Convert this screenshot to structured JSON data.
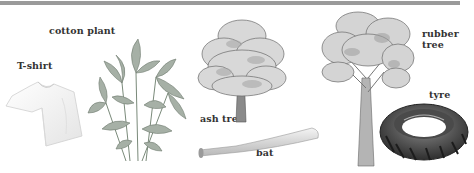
{
  "header_bar": {
    "color": "#9a9a9a"
  },
  "items": [
    {
      "id": "cotton",
      "source_label": "cotton plant",
      "product_label": "T-shirt"
    },
    {
      "id": "ash",
      "source_label": "ash tree",
      "product_label": "bat"
    },
    {
      "id": "rubber",
      "source_label": "rubber\ntree",
      "product_label": "tyre"
    }
  ],
  "labels": {
    "cotton_plant": "cotton plant",
    "tshirt": "T-shirt",
    "ash_tree": "ash tree",
    "bat": "bat",
    "rubber_line1": "rubber",
    "rubber_line2": "tree",
    "tyre": "tyre"
  },
  "icons": {
    "tshirt": "tshirt-icon",
    "cotton_plant": "cotton-plant-icon",
    "ash_tree": "ash-tree-icon",
    "bat": "baseball-bat-icon",
    "rubber_tree": "rubber-tree-icon",
    "tyre": "tyre-icon"
  }
}
